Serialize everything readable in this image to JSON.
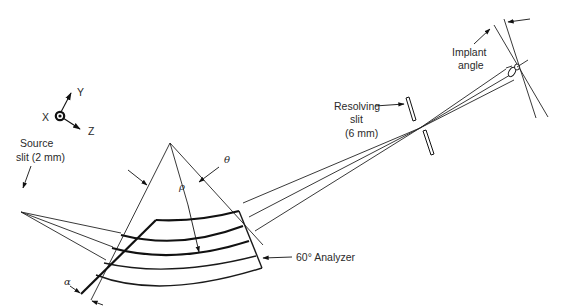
{
  "diagram": {
    "labels": {
      "axis_x": "X",
      "axis_y": "Y",
      "axis_z": "Z",
      "source_line1": "Source",
      "source_line2": "slit (2  mm)",
      "theta": "θ",
      "rho": "ρ",
      "alpha": "α",
      "analyzer": "60° Analyzer",
      "resolving_line1": "Resolving",
      "resolving_line2": "slit",
      "resolving_line3": "(6  mm)",
      "implant_line1": "Implant",
      "implant_line2": "angle"
    },
    "components": [
      {
        "name": "coordinate-axes",
        "label": "X, Y, Z"
      },
      {
        "name": "source-slit",
        "label": "Source slit (2 mm)"
      },
      {
        "name": "analyzer-magnet",
        "label": "60° Analyzer"
      },
      {
        "name": "resolving-slit",
        "label": "Resolving slit (6 mm)"
      },
      {
        "name": "implant-target",
        "label": "Implant angle"
      }
    ],
    "colors": {
      "line": "#222222",
      "background": "#ffffff"
    }
  }
}
